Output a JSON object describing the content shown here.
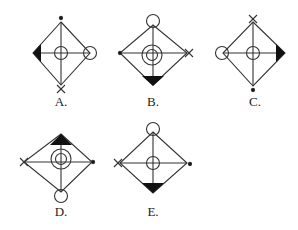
{
  "figure": {
    "stroke_color": "#333333",
    "fill_color": "#111111",
    "options": [
      {
        "label": "A.",
        "center": [
          61,
          53
        ],
        "top": "dot",
        "bottom": "cross",
        "left": "filled-triangle",
        "right": "circle",
        "center_symbol": "circle"
      },
      {
        "label": "B.",
        "center": [
          153,
          53
        ],
        "top": "circle",
        "bottom": "filled-triangle",
        "left": "dot",
        "right": "cross",
        "center_symbol": "double-circle"
      },
      {
        "label": "C.",
        "center": [
          253,
          53
        ],
        "top": "cross",
        "bottom": "dot",
        "left": "circle",
        "right": "filled-triangle",
        "center_symbol": "circle"
      },
      {
        "label": "D.",
        "center": [
          61,
          162
        ],
        "top": "filled-triangle",
        "bottom": "circle",
        "left": "cross",
        "right": "dot",
        "center_symbol": "double-circle"
      },
      {
        "label": "E.",
        "center": [
          153,
          163
        ],
        "top": "circle",
        "bottom": "filled-triangle",
        "left": "cross",
        "right": "dot",
        "center_symbol": "circle"
      }
    ]
  }
}
